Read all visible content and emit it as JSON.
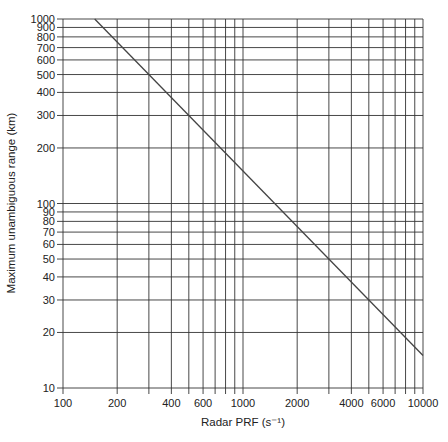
{
  "chart_data": {
    "type": "line",
    "title": "",
    "xlabel": "Radar PRF (s⁻¹)",
    "ylabel": "Maximum unambiguous range (km)",
    "xscale": "log",
    "yscale": "log",
    "xlim": [
      100,
      10000
    ],
    "ylim": [
      10,
      1000
    ],
    "grid": true,
    "x_tick_labels": [
      {
        "value": 100,
        "label": "100"
      },
      {
        "value": 200,
        "label": "200"
      },
      {
        "value": 400,
        "label": "400"
      },
      {
        "value": 600,
        "label": "600"
      },
      {
        "value": 1000,
        "label": "1000"
      },
      {
        "value": 2000,
        "label": "2000"
      },
      {
        "value": 4000,
        "label": "4000"
      },
      {
        "value": 6000,
        "label": "6000"
      },
      {
        "value": 10000,
        "label": "10000"
      }
    ],
    "x_gridlines": [
      100,
      200,
      300,
      400,
      500,
      600,
      700,
      800,
      900,
      1000,
      2000,
      3000,
      4000,
      5000,
      6000,
      7000,
      8000,
      9000,
      10000
    ],
    "y_tick_labels": [
      {
        "value": 10,
        "label": "10"
      },
      {
        "value": 20,
        "label": "20"
      },
      {
        "value": 30,
        "label": "30"
      },
      {
        "value": 40,
        "label": "40"
      },
      {
        "value": 50,
        "label": "50"
      },
      {
        "value": 60,
        "label": "60"
      },
      {
        "value": 70,
        "label": "70"
      },
      {
        "value": 80,
        "label": "80"
      },
      {
        "value": 90,
        "label": "90"
      },
      {
        "value": 100,
        "label": "100"
      },
      {
        "value": 200,
        "label": "200"
      },
      {
        "value": 300,
        "label": "300"
      },
      {
        "value": 400,
        "label": "400"
      },
      {
        "value": 500,
        "label": "500"
      },
      {
        "value": 600,
        "label": "600"
      },
      {
        "value": 700,
        "label": "700"
      },
      {
        "value": 800,
        "label": "800"
      },
      {
        "value": 900,
        "label": "900"
      },
      {
        "value": 1000,
        "label": "1000"
      }
    ],
    "series": [
      {
        "name": "Maximum unambiguous range",
        "x": [
          150,
          10000
        ],
        "y": [
          1000,
          15
        ]
      }
    ],
    "legend": "none"
  },
  "colors": {
    "grid": "#333333",
    "line": "#444444",
    "text": "#222222"
  }
}
